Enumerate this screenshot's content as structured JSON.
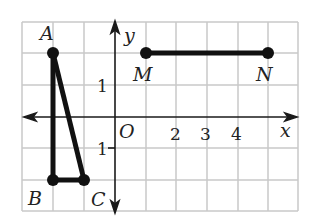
{
  "diagram": {
    "axes": {
      "x_label": "x",
      "y_label": "y",
      "origin_label": "O"
    },
    "x_tick_labels": [
      "2",
      "3",
      "4"
    ],
    "y_tick_labels": [
      "1",
      "-1"
    ],
    "points": [
      {
        "name": "A",
        "x": -2,
        "y": 2
      },
      {
        "name": "B",
        "x": -2,
        "y": -2
      },
      {
        "name": "C",
        "x": -1,
        "y": -2
      },
      {
        "name": "M",
        "x": 1,
        "y": 2
      },
      {
        "name": "N",
        "x": 5,
        "y": 2
      }
    ],
    "segments": [
      "AB",
      "BC",
      "CA",
      "MN"
    ],
    "colors": {
      "grid": "#c8c8c8",
      "ink": "#1a1a1a",
      "background": "#ffffff"
    }
  }
}
